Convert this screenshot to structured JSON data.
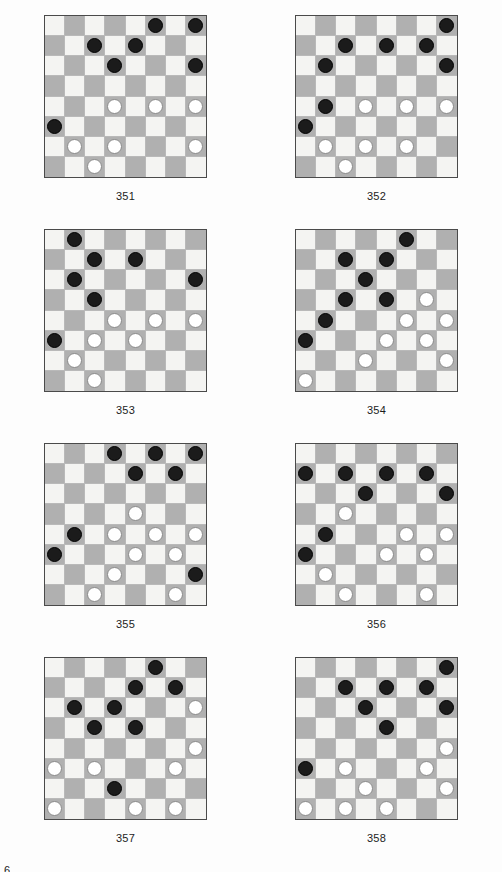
{
  "document": {
    "type": "checkers-puzzle-page",
    "page_number_partial": "6",
    "board_size": 8,
    "colors": {
      "light_square": "#f4f4f2",
      "dark_square": "#b0b0b0",
      "black_piece": "#1b1b1b",
      "white_piece": "#ffffff",
      "board_border": "#4a4a4a",
      "grid_line": "#b9b9b9",
      "page_background": "#fdfdfd",
      "text": "#1c1c1c"
    }
  },
  "puzzles": [
    {
      "label": "351",
      "black": [
        [
          0,
          5
        ],
        [
          0,
          7
        ],
        [
          1,
          2
        ],
        [
          1,
          4
        ],
        [
          2,
          3
        ],
        [
          2,
          7
        ],
        [
          5,
          0
        ]
      ],
      "white": [
        [
          4,
          3
        ],
        [
          4,
          5
        ],
        [
          4,
          7
        ],
        [
          6,
          1
        ],
        [
          6,
          3
        ],
        [
          6,
          7
        ],
        [
          7,
          2
        ]
      ]
    },
    {
      "label": "352",
      "black": [
        [
          0,
          7
        ],
        [
          1,
          2
        ],
        [
          1,
          4
        ],
        [
          1,
          6
        ],
        [
          2,
          1
        ],
        [
          2,
          7
        ],
        [
          4,
          1
        ],
        [
          5,
          0
        ]
      ],
      "white": [
        [
          4,
          3
        ],
        [
          4,
          5
        ],
        [
          4,
          7
        ],
        [
          6,
          1
        ],
        [
          6,
          3
        ],
        [
          6,
          5
        ],
        [
          7,
          2
        ]
      ]
    },
    {
      "label": "353",
      "black": [
        [
          0,
          1
        ],
        [
          1,
          2
        ],
        [
          1,
          4
        ],
        [
          2,
          1
        ],
        [
          2,
          7
        ],
        [
          3,
          2
        ],
        [
          5,
          0
        ]
      ],
      "white": [
        [
          4,
          3
        ],
        [
          4,
          5
        ],
        [
          4,
          7
        ],
        [
          5,
          2
        ],
        [
          5,
          4
        ],
        [
          6,
          1
        ],
        [
          7,
          2
        ]
      ]
    },
    {
      "label": "354",
      "black": [
        [
          0,
          5
        ],
        [
          1,
          2
        ],
        [
          1,
          4
        ],
        [
          2,
          3
        ],
        [
          3,
          2
        ],
        [
          3,
          4
        ],
        [
          4,
          1
        ],
        [
          5,
          0
        ]
      ],
      "white": [
        [
          3,
          6
        ],
        [
          4,
          5
        ],
        [
          4,
          7
        ],
        [
          5,
          4
        ],
        [
          5,
          6
        ],
        [
          6,
          3
        ],
        [
          6,
          7
        ],
        [
          7,
          0
        ]
      ]
    },
    {
      "label": "355",
      "black": [
        [
          0,
          3
        ],
        [
          0,
          5
        ],
        [
          0,
          7
        ],
        [
          1,
          4
        ],
        [
          1,
          6
        ],
        [
          4,
          1
        ],
        [
          5,
          0
        ],
        [
          6,
          7
        ]
      ],
      "white": [
        [
          3,
          4
        ],
        [
          4,
          3
        ],
        [
          4,
          5
        ],
        [
          4,
          7
        ],
        [
          5,
          4
        ],
        [
          5,
          6
        ],
        [
          6,
          3
        ],
        [
          7,
          2
        ],
        [
          7,
          6
        ]
      ]
    },
    {
      "label": "356",
      "black": [
        [
          1,
          0
        ],
        [
          1,
          2
        ],
        [
          1,
          4
        ],
        [
          1,
          6
        ],
        [
          2,
          3
        ],
        [
          2,
          7
        ],
        [
          4,
          1
        ],
        [
          5,
          0
        ]
      ],
      "white": [
        [
          3,
          2
        ],
        [
          4,
          5
        ],
        [
          4,
          7
        ],
        [
          5,
          4
        ],
        [
          5,
          6
        ],
        [
          6,
          1
        ],
        [
          7,
          2
        ],
        [
          7,
          6
        ]
      ]
    },
    {
      "label": "357",
      "black": [
        [
          0,
          5
        ],
        [
          1,
          4
        ],
        [
          1,
          6
        ],
        [
          2,
          1
        ],
        [
          2,
          3
        ],
        [
          3,
          2
        ],
        [
          3,
          4
        ],
        [
          6,
          3
        ]
      ],
      "white": [
        [
          2,
          7
        ],
        [
          4,
          7
        ],
        [
          5,
          0
        ],
        [
          5,
          2
        ],
        [
          5,
          6
        ],
        [
          7,
          0
        ],
        [
          7,
          4
        ],
        [
          7,
          6
        ]
      ]
    },
    {
      "label": "358",
      "black": [
        [
          0,
          7
        ],
        [
          1,
          2
        ],
        [
          1,
          4
        ],
        [
          1,
          6
        ],
        [
          2,
          3
        ],
        [
          2,
          7
        ],
        [
          3,
          4
        ],
        [
          5,
          0
        ]
      ],
      "white": [
        [
          4,
          7
        ],
        [
          5,
          2
        ],
        [
          5,
          6
        ],
        [
          6,
          3
        ],
        [
          6,
          7
        ],
        [
          7,
          0
        ],
        [
          7,
          2
        ],
        [
          7,
          4
        ]
      ]
    }
  ]
}
